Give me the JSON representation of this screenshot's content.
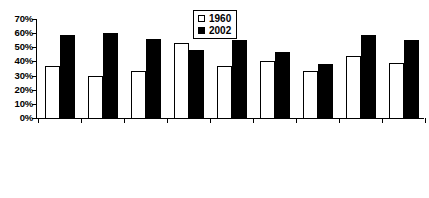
{
  "chart_data": {
    "type": "bar",
    "title": "",
    "xlabel": "",
    "ylabel": "",
    "ylim": [
      0,
      70
    ],
    "grid": false,
    "legend_position": "top-center",
    "ytick_labels": [
      "70%",
      "60%",
      "50%",
      "40%",
      "30%",
      "20%",
      "10%",
      "0%"
    ],
    "ytick_values": [
      70,
      60,
      50,
      40,
      30,
      20,
      10,
      0
    ],
    "categories": [
      "U.S.",
      "Canada",
      "Australia*",
      "Japan",
      "France+",
      "Germany**",
      "Italy**",
      "Sweden+",
      "U.K.**"
    ],
    "series": [
      {
        "name": "1960",
        "color": "#ffffff",
        "values": [
          37,
          30,
          33,
          53,
          37,
          40,
          33,
          44,
          39
        ]
      },
      {
        "name": "2002",
        "color": "#000000",
        "values": [
          59,
          60,
          56,
          48,
          55,
          47,
          38,
          59,
          55
        ]
      }
    ]
  },
  "legend": {
    "entries": [
      {
        "label": "1960",
        "swatch": "open-square-icon"
      },
      {
        "label": "2002",
        "swatch": "filled-square-icon"
      }
    ]
  }
}
